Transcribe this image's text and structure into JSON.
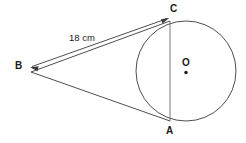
{
  "figure": {
    "background_color": "#ffffff",
    "stroke_color": "#3a3a3a",
    "text_color": "#1b1b1b",
    "labels": {
      "point_a": "A",
      "point_b": "B",
      "point_c": "C",
      "center_o": "O"
    },
    "measurements": {
      "segment_bc": "18 cm"
    },
    "geometry": {
      "circle": {
        "cx": 186,
        "cy": 71,
        "r": 50
      },
      "point_a": {
        "x": 170,
        "y": 121
      },
      "point_b": {
        "x": 31,
        "y": 71
      },
      "point_c": {
        "x": 170,
        "y": 21
      },
      "center_dot": {
        "x": 186,
        "y": 72,
        "r": 1.7
      },
      "chord_ca": {
        "x1": 170,
        "y1": 21,
        "x2": 170,
        "y2": 121
      },
      "dimension_line": {
        "x1": 31,
        "y1": 66,
        "x2": 168,
        "y2": 18
      }
    }
  }
}
